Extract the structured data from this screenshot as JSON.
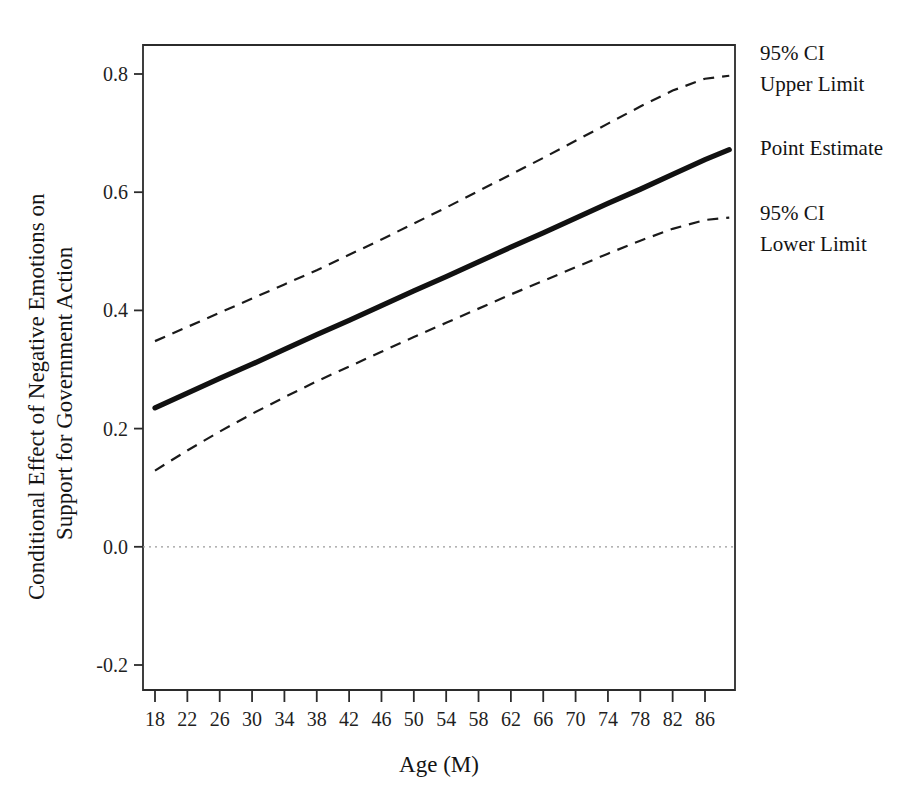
{
  "chart_data": {
    "type": "line",
    "title": "",
    "xlabel": "Age (M)",
    "ylabel": "Conditional Effect of Negative Emotions on Support for Government Action",
    "ylabel_line1": "Conditional Effect of Negative Emotions on",
    "ylabel_line2": "Support for Government Action",
    "xlim": [
      16,
      90
    ],
    "ylim": [
      -0.28,
      0.88
    ],
    "xticks": [
      18,
      22,
      26,
      30,
      34,
      38,
      42,
      46,
      50,
      54,
      58,
      62,
      66,
      70,
      74,
      78,
      82,
      86
    ],
    "xtick_labels": [
      "18",
      "22",
      "26",
      "30",
      "34",
      "38",
      "42",
      "46",
      "50",
      "54",
      "58",
      "62",
      "66",
      "70",
      "74",
      "78",
      "82",
      "86"
    ],
    "yticks": [
      0.8,
      0.6,
      0.4,
      0.2,
      0.0,
      -0.2
    ],
    "ytick_labels": [
      "0.8",
      "0.6",
      "0.4",
      "0.2",
      "0.0",
      "-0.2"
    ],
    "grid": false,
    "legend_position": "right-outside",
    "reference_line": {
      "name": "zero-reference-line",
      "y": 0.0,
      "style": "dotted",
      "color": "#9a9a9a"
    },
    "x": [
      18,
      22,
      26,
      30,
      34,
      38,
      42,
      46,
      50,
      54,
      58,
      62,
      66,
      70,
      74,
      78,
      82,
      86,
      89
    ],
    "series": [
      {
        "name": "95% CI Upper Limit",
        "style": "dashed",
        "color": "#1a1a1a",
        "values": [
          0.348,
          0.372,
          0.396,
          0.42,
          0.444,
          0.468,
          0.494,
          0.52,
          0.547,
          0.574,
          0.602,
          0.63,
          0.658,
          0.687,
          0.716,
          0.745,
          0.772,
          0.792,
          0.797
        ]
      },
      {
        "name": "Point Estimate",
        "style": "solid",
        "color": "#111111",
        "values": [
          0.235,
          0.26,
          0.285,
          0.309,
          0.334,
          0.359,
          0.383,
          0.408,
          0.433,
          0.457,
          0.482,
          0.507,
          0.531,
          0.556,
          0.581,
          0.605,
          0.63,
          0.655,
          0.672
        ]
      },
      {
        "name": "95% CI Lower Limit",
        "style": "dashed",
        "color": "#1a1a1a",
        "values": [
          0.129,
          0.163,
          0.195,
          0.225,
          0.253,
          0.28,
          0.305,
          0.33,
          0.355,
          0.379,
          0.403,
          0.427,
          0.45,
          0.473,
          0.496,
          0.518,
          0.538,
          0.553,
          0.557
        ]
      }
    ],
    "annotations": [
      {
        "name": "ci-upper-annotation",
        "line1": "95% CI",
        "line2": "Upper Limit",
        "x": 760,
        "y": 60
      },
      {
        "name": "point-estimate-annotation",
        "line1": "Point Estimate",
        "line2": "",
        "x": 760,
        "y": 155
      },
      {
        "name": "ci-lower-annotation",
        "line1": "95% CI",
        "line2": "Lower Limit",
        "x": 760,
        "y": 220
      }
    ]
  }
}
